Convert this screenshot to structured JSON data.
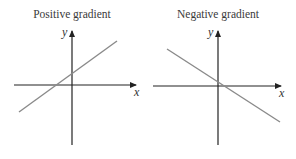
{
  "panels": [
    {
      "title": "Positive gradient",
      "x_label": "x",
      "y_label": "y",
      "gradient_sign": "positive"
    },
    {
      "title": "Negative gradient",
      "x_label": "x",
      "y_label": "y",
      "gradient_sign": "negative"
    }
  ],
  "colors": {
    "axis": "#222222",
    "line": "#8a8a8a",
    "text": "#3a3a3a"
  }
}
